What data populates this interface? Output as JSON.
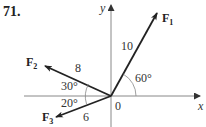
{
  "problem": {
    "number": "71."
  },
  "axes": {
    "x_label": "x",
    "y_label": "y",
    "origin_label": "0"
  },
  "forces": [
    {
      "name": "F",
      "subscript": "1",
      "magnitude": "10",
      "angle_label": "60°"
    },
    {
      "name": "F",
      "subscript": "2",
      "magnitude": "8",
      "angle_label": "30°"
    },
    {
      "name": "F",
      "subscript": "3",
      "magnitude": "6",
      "angle_label": "20°"
    }
  ],
  "colors": {
    "axis": "#888888",
    "vector": "#222222",
    "text": "#333333"
  }
}
